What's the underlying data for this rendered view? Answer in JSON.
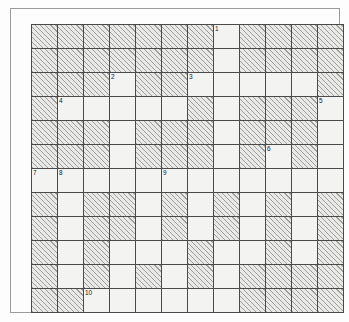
{
  "puzzle": {
    "title": "Crossword Grid",
    "type": "crossword-grid",
    "columns": 12,
    "rows": 12,
    "cell_size_px": 26,
    "colors": {
      "open_cell": "#f3f3f1",
      "blocked_cell_fill": "#e9e9e6",
      "blocked_cell_hatch": "#9d9d9d",
      "grid_line": "#4a4a4a",
      "frame_border": "#9a9a9a",
      "page_background": "#fdfdfd",
      "number_text": "#1a1a1a"
    },
    "legend": {
      "open_meaning": "open letter square",
      "blocked_meaning": "hatched blocked square"
    },
    "clue_numbers": [
      {
        "number": "1",
        "row": 1,
        "col": 8
      },
      {
        "number": "2",
        "row": 3,
        "col": 4
      },
      {
        "number": "3",
        "row": 3,
        "col": 7
      },
      {
        "number": "4",
        "row": 4,
        "col": 2
      },
      {
        "number": "5",
        "row": 4,
        "col": 12
      },
      {
        "number": "6",
        "row": 6,
        "col": 10
      },
      {
        "number": "7",
        "row": 7,
        "col": 1
      },
      {
        "number": "8",
        "row": 7,
        "col": 2
      },
      {
        "number": "9",
        "row": 7,
        "col": 6
      },
      {
        "number": "10",
        "row": 12,
        "col": 3
      }
    ],
    "grid": [
      [
        0,
        0,
        0,
        0,
        0,
        0,
        0,
        1,
        0,
        0,
        0,
        0
      ],
      [
        0,
        0,
        0,
        0,
        0,
        0,
        0,
        1,
        0,
        0,
        0,
        0
      ],
      [
        0,
        0,
        0,
        1,
        0,
        0,
        1,
        1,
        1,
        1,
        1,
        0
      ],
      [
        0,
        1,
        1,
        1,
        1,
        1,
        0,
        1,
        0,
        0,
        0,
        1
      ],
      [
        0,
        0,
        0,
        1,
        0,
        0,
        0,
        1,
        0,
        0,
        0,
        1
      ],
      [
        0,
        0,
        0,
        1,
        0,
        0,
        0,
        1,
        0,
        1,
        0,
        1
      ],
      [
        1,
        1,
        1,
        1,
        1,
        1,
        1,
        1,
        1,
        1,
        1,
        1
      ],
      [
        0,
        1,
        0,
        0,
        1,
        0,
        1,
        0,
        1,
        0,
        1,
        0
      ],
      [
        0,
        1,
        0,
        0,
        1,
        0,
        1,
        0,
        1,
        0,
        1,
        0
      ],
      [
        0,
        1,
        0,
        1,
        1,
        1,
        0,
        1,
        1,
        0,
        1,
        0
      ],
      [
        0,
        1,
        0,
        1,
        0,
        1,
        0,
        1,
        0,
        0,
        0,
        0
      ],
      [
        0,
        0,
        1,
        1,
        1,
        1,
        1,
        1,
        0,
        0,
        0,
        0
      ]
    ]
  }
}
